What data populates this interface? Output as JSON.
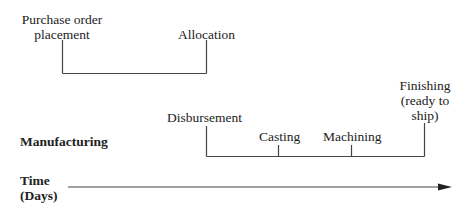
{
  "diagram": {
    "purchase_phase": {
      "start_label": "Purchase order placement",
      "start_label_lines": [
        "Purchase order",
        "placement"
      ],
      "end_label": "Allocation"
    },
    "manufacturing_phase": {
      "row_label": "Manufacturing",
      "milestones": [
        {
          "label": "Disbursement"
        },
        {
          "label": "Casting"
        },
        {
          "label": "Machining"
        },
        {
          "label": "Finishing (ready to ship)",
          "lines": [
            "Finishing",
            "(ready to",
            "ship)"
          ]
        }
      ]
    },
    "time_axis": {
      "label_lines": [
        "Time",
        "(Days)"
      ]
    },
    "colors": {
      "line": "#444444",
      "text": "#222222",
      "background": "#ffffff"
    }
  }
}
